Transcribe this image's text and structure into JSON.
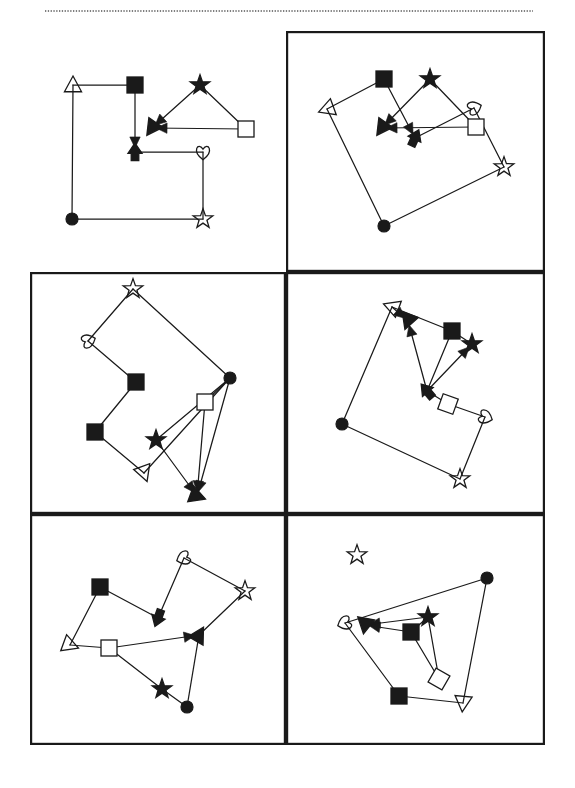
{
  "page": {
    "width": 575,
    "height": 788,
    "background_color": "#ffffff",
    "ink_color": "#1a1a1a",
    "header_rule": {
      "name": "dotted-header-rule",
      "style": "dotted",
      "x1": 45,
      "y1": 11,
      "x2": 533,
      "y2": 11,
      "color": "#555555"
    },
    "grid": {
      "columns": 2,
      "rows": 3,
      "border_color": "#1a1a1a",
      "border_width": 2.2,
      "cells": [
        {
          "name": "panel-top-left",
          "row": 1,
          "col": 1,
          "x": 30,
          "y": 31,
          "w": 256,
          "h": 241,
          "bordered": false
        },
        {
          "name": "panel-top-right",
          "row": 1,
          "col": 2,
          "x": 286,
          "y": 31,
          "w": 259,
          "h": 241,
          "bordered": true
        },
        {
          "name": "panel-middle-left",
          "row": 2,
          "col": 1,
          "x": 30,
          "y": 272,
          "w": 256,
          "h": 242,
          "bordered": true
        },
        {
          "name": "panel-middle-right",
          "row": 2,
          "col": 2,
          "x": 286,
          "y": 272,
          "w": 259,
          "h": 242,
          "bordered": true
        },
        {
          "name": "panel-bottom-left",
          "row": 3,
          "col": 1,
          "x": 30,
          "y": 514,
          "w": 256,
          "h": 231,
          "bordered": true
        },
        {
          "name": "panel-bottom-right",
          "row": 3,
          "col": 2,
          "x": 286,
          "y": 514,
          "w": 259,
          "h": 231,
          "bordered": true
        }
      ]
    }
  },
  "marker_legend": [
    {
      "key": "open-triangle",
      "label": "open triangle",
      "fill": "none",
      "stroke": "#1a1a1a"
    },
    {
      "key": "filled-triangle",
      "label": "filled triangle",
      "fill": "#1a1a1a",
      "stroke": "#1a1a1a"
    },
    {
      "key": "open-square",
      "label": "open square",
      "fill": "#ffffff",
      "stroke": "#1a1a1a"
    },
    {
      "key": "filled-square",
      "label": "filled square",
      "fill": "#1a1a1a",
      "stroke": "#1a1a1a"
    },
    {
      "key": "open-star",
      "label": "open star",
      "fill": "none",
      "stroke": "#1a1a1a"
    },
    {
      "key": "filled-star",
      "label": "filled star",
      "fill": "#1a1a1a",
      "stroke": "#1a1a1a"
    },
    {
      "key": "open-heart",
      "label": "open heart",
      "fill": "none",
      "stroke": "#1a1a1a"
    },
    {
      "key": "filled-circle",
      "label": "filled circle",
      "fill": "#1a1a1a",
      "stroke": "#1a1a1a"
    }
  ],
  "figures": [
    {
      "panel": "panel-top-left",
      "name": "figure-reference",
      "rotation_deg": 0,
      "nodes": [
        {
          "id": "n1",
          "shape": "open-triangle",
          "x": 73,
          "y": 85,
          "size": 9
        },
        {
          "id": "n2",
          "shape": "filled-square",
          "x": 135,
          "y": 85,
          "size": 8
        },
        {
          "id": "n3",
          "shape": "filled-arrow",
          "x": 135,
          "y": 152,
          "size": 9,
          "angle": 0
        },
        {
          "id": "n4",
          "shape": "open-heart",
          "x": 203,
          "y": 152,
          "size": 9
        },
        {
          "id": "n5",
          "shape": "open-star",
          "x": 203,
          "y": 219,
          "size": 9
        },
        {
          "id": "n6",
          "shape": "filled-circle",
          "x": 72,
          "y": 219,
          "size": 6
        },
        {
          "id": "n7",
          "shape": "filled-star",
          "x": 200,
          "y": 85,
          "size": 9
        },
        {
          "id": "n8",
          "shape": "open-square",
          "x": 246,
          "y": 129,
          "size": 8
        },
        {
          "id": "n9",
          "shape": "filled-triangle",
          "x": 152,
          "y": 128,
          "size": 9,
          "angle": 215
        }
      ],
      "edges": [
        {
          "from": "n1",
          "to": "n2",
          "arrow": false
        },
        {
          "from": "n2",
          "to": "n3",
          "arrow": true
        },
        {
          "from": "n3",
          "to": "n4",
          "arrow": false
        },
        {
          "from": "n4",
          "to": "n5",
          "arrow": false
        },
        {
          "from": "n5",
          "to": "n6",
          "arrow": false
        },
        {
          "from": "n6",
          "to": "n1",
          "arrow": false
        },
        {
          "from": "n7",
          "to": "n9",
          "arrow": true
        },
        {
          "from": "n7",
          "to": "n8",
          "arrow": false
        },
        {
          "from": "n8",
          "to": "n9",
          "arrow": true
        }
      ]
    },
    {
      "panel": "panel-top-right",
      "name": "figure-rotated-a",
      "rotation_deg": 20,
      "nodes": [
        {
          "id": "n1",
          "shape": "open-triangle",
          "x": 327,
          "y": 109,
          "size": 9,
          "angle": 250
        },
        {
          "id": "n2",
          "shape": "filled-square",
          "x": 384,
          "y": 79,
          "size": 8
        },
        {
          "id": "n3",
          "shape": "filled-arrow",
          "x": 415,
          "y": 138,
          "size": 9,
          "angle": 25
        },
        {
          "id": "n4",
          "shape": "open-heart",
          "x": 474,
          "y": 108,
          "size": 9,
          "angle": 250
        },
        {
          "id": "n5",
          "shape": "open-star",
          "x": 504,
          "y": 167,
          "size": 9
        },
        {
          "id": "n6",
          "shape": "filled-circle",
          "x": 384,
          "y": 226,
          "size": 6
        },
        {
          "id": "n7",
          "shape": "filled-star",
          "x": 430,
          "y": 79,
          "size": 9
        },
        {
          "id": "n8",
          "shape": "open-square",
          "x": 476,
          "y": 127,
          "size": 8
        },
        {
          "id": "n9",
          "shape": "filled-triangle",
          "x": 382,
          "y": 128,
          "size": 9,
          "angle": 215
        }
      ],
      "edges": [
        {
          "from": "n1",
          "to": "n2",
          "arrow": false
        },
        {
          "from": "n2",
          "to": "n3",
          "arrow": true
        },
        {
          "from": "n3",
          "to": "n4",
          "arrow": false
        },
        {
          "from": "n4",
          "to": "n5",
          "arrow": false
        },
        {
          "from": "n5",
          "to": "n6",
          "arrow": false
        },
        {
          "from": "n6",
          "to": "n1",
          "arrow": false
        },
        {
          "from": "n7",
          "to": "n9",
          "arrow": true
        },
        {
          "from": "n7",
          "to": "n8",
          "arrow": false
        },
        {
          "from": "n8",
          "to": "n9",
          "arrow": true
        }
      ]
    },
    {
      "panel": "panel-middle-left",
      "name": "figure-rotated-b",
      "rotation_deg": 130,
      "nodes": [
        {
          "id": "n1",
          "shape": "open-star",
          "x": 133,
          "y": 289,
          "size": 9
        },
        {
          "id": "n2",
          "shape": "open-heart",
          "x": 88,
          "y": 341,
          "size": 9,
          "angle": 250
        },
        {
          "id": "n3",
          "shape": "filled-square",
          "x": 136,
          "y": 382,
          "size": 8
        },
        {
          "id": "n4",
          "shape": "filled-square",
          "x": 95,
          "y": 432,
          "size": 8
        },
        {
          "id": "n5",
          "shape": "open-triangle",
          "x": 144,
          "y": 473,
          "size": 9,
          "angle": 160
        },
        {
          "id": "n6",
          "shape": "filled-circle",
          "x": 230,
          "y": 378,
          "size": 6
        },
        {
          "id": "n7",
          "shape": "open-square",
          "x": 205,
          "y": 402,
          "size": 8
        },
        {
          "id": "n8",
          "shape": "filled-star",
          "x": 156,
          "y": 440,
          "size": 9
        },
        {
          "id": "n9",
          "shape": "filled-triangle",
          "x": 197,
          "y": 496,
          "size": 9,
          "angle": 110
        }
      ],
      "edges": [
        {
          "from": "n1",
          "to": "n2",
          "arrow": false
        },
        {
          "from": "n2",
          "to": "n3",
          "arrow": false
        },
        {
          "from": "n3",
          "to": "n4",
          "arrow": false
        },
        {
          "from": "n4",
          "to": "n5",
          "arrow": false
        },
        {
          "from": "n5",
          "to": "n6",
          "arrow": false
        },
        {
          "from": "n6",
          "to": "n1",
          "arrow": false
        },
        {
          "from": "n6",
          "to": "n7",
          "arrow": false
        },
        {
          "from": "n6",
          "to": "n8",
          "arrow": false
        },
        {
          "from": "n7",
          "to": "n9",
          "arrow": true
        },
        {
          "from": "n8",
          "to": "n9",
          "arrow": true
        },
        {
          "from": "n6",
          "to": "n9",
          "arrow": true
        }
      ]
    },
    {
      "panel": "panel-middle-right",
      "name": "figure-rotated-c",
      "rotation_deg": 310,
      "nodes": [
        {
          "id": "n1",
          "shape": "open-triangle",
          "x": 392,
          "y": 307,
          "size": 9,
          "angle": 290
        },
        {
          "id": "n2",
          "shape": "filled-square",
          "x": 452,
          "y": 331,
          "size": 8
        },
        {
          "id": "n3",
          "shape": "filled-star",
          "x": 472,
          "y": 344,
          "size": 9
        },
        {
          "id": "n4",
          "shape": "filled-triangle",
          "x": 408,
          "y": 321,
          "size": 9,
          "angle": 200
        },
        {
          "id": "n5",
          "shape": "filled-arrow",
          "x": 427,
          "y": 391,
          "size": 9,
          "angle": 320
        },
        {
          "id": "n6",
          "shape": "open-square",
          "x": 448,
          "y": 404,
          "size": 8,
          "angle": 20
        },
        {
          "id": "n7",
          "shape": "open-heart",
          "x": 485,
          "y": 417,
          "size": 9,
          "angle": 290
        },
        {
          "id": "n8",
          "shape": "open-star",
          "x": 460,
          "y": 479,
          "size": 9
        },
        {
          "id": "n9",
          "shape": "filled-circle",
          "x": 342,
          "y": 424,
          "size": 6
        }
      ],
      "edges": [
        {
          "from": "n1",
          "to": "n2",
          "arrow": false
        },
        {
          "from": "n1",
          "to": "n4",
          "arrow": true
        },
        {
          "from": "n5",
          "to": "n4",
          "arrow": true
        },
        {
          "from": "n5",
          "to": "n2",
          "arrow": false
        },
        {
          "from": "n5",
          "to": "n3",
          "arrow": true
        },
        {
          "from": "n2",
          "to": "n3",
          "arrow": false
        },
        {
          "from": "n5",
          "to": "n6",
          "arrow": false
        },
        {
          "from": "n6",
          "to": "n7",
          "arrow": false
        },
        {
          "from": "n7",
          "to": "n8",
          "arrow": false
        },
        {
          "from": "n8",
          "to": "n9",
          "arrow": false
        },
        {
          "from": "n9",
          "to": "n1",
          "arrow": false
        }
      ]
    },
    {
      "panel": "panel-bottom-left",
      "name": "figure-rotated-d",
      "rotation_deg": 200,
      "nodes": [
        {
          "id": "n1",
          "shape": "open-heart",
          "x": 184,
          "y": 558,
          "size": 9,
          "angle": 70
        },
        {
          "id": "n2",
          "shape": "open-star",
          "x": 245,
          "y": 591,
          "size": 9
        },
        {
          "id": "n3",
          "shape": "filled-square",
          "x": 100,
          "y": 587,
          "size": 8
        },
        {
          "id": "n4",
          "shape": "filled-arrow",
          "x": 158,
          "y": 618,
          "size": 9,
          "angle": 200
        },
        {
          "id": "n5",
          "shape": "open-triangle",
          "x": 70,
          "y": 645,
          "size": 9,
          "angle": 110
        },
        {
          "id": "n6",
          "shape": "open-square",
          "x": 109,
          "y": 648,
          "size": 8
        },
        {
          "id": "n7",
          "shape": "filled-triangle",
          "x": 199,
          "y": 635,
          "size": 9,
          "angle": 30
        },
        {
          "id": "n8",
          "shape": "filled-star",
          "x": 162,
          "y": 689,
          "size": 9
        },
        {
          "id": "n9",
          "shape": "filled-circle",
          "x": 187,
          "y": 707,
          "size": 6
        }
      ],
      "edges": [
        {
          "from": "n1",
          "to": "n2",
          "arrow": false
        },
        {
          "from": "n1",
          "to": "n4",
          "arrow": false
        },
        {
          "from": "n4",
          "to": "n3",
          "arrow": false
        },
        {
          "from": "n3",
          "to": "n5",
          "arrow": false
        },
        {
          "from": "n5",
          "to": "n6",
          "arrow": false
        },
        {
          "from": "n6",
          "to": "n7",
          "arrow": true
        },
        {
          "from": "n2",
          "to": "n7",
          "arrow": false
        },
        {
          "from": "n6",
          "to": "n8",
          "arrow": false
        },
        {
          "from": "n8",
          "to": "n9",
          "arrow": false
        },
        {
          "from": "n9",
          "to": "n7",
          "arrow": false
        }
      ]
    },
    {
      "panel": "panel-bottom-right",
      "name": "figure-rotated-e",
      "rotation_deg": 75,
      "nodes": [
        {
          "id": "n0",
          "shape": "open-star",
          "x": 357,
          "y": 555,
          "size": 9,
          "detached": true
        },
        {
          "id": "n1",
          "shape": "filled-circle",
          "x": 487,
          "y": 578,
          "size": 6
        },
        {
          "id": "n2",
          "shape": "open-heart",
          "x": 345,
          "y": 623,
          "size": 9,
          "angle": 70
        },
        {
          "id": "n3",
          "shape": "filled-triangle",
          "x": 365,
          "y": 625,
          "size": 9,
          "angle": 190
        },
        {
          "id": "n4",
          "shape": "filled-star",
          "x": 428,
          "y": 617,
          "size": 9
        },
        {
          "id": "n5",
          "shape": "filled-square",
          "x": 411,
          "y": 632,
          "size": 8
        },
        {
          "id": "n6",
          "shape": "open-square",
          "x": 439,
          "y": 679,
          "size": 8,
          "angle": 30
        },
        {
          "id": "n7",
          "shape": "filled-square",
          "x": 399,
          "y": 696,
          "size": 8
        },
        {
          "id": "n8",
          "shape": "open-triangle",
          "x": 463,
          "y": 703,
          "size": 9,
          "angle": 185
        }
      ],
      "edges": [
        {
          "from": "n1",
          "to": "n2",
          "arrow": false
        },
        {
          "from": "n4",
          "to": "n3",
          "arrow": true
        },
        {
          "from": "n5",
          "to": "n3",
          "arrow": true
        },
        {
          "from": "n4",
          "to": "n5",
          "arrow": false
        },
        {
          "from": "n4",
          "to": "n6",
          "arrow": false
        },
        {
          "from": "n5",
          "to": "n6",
          "arrow": false
        },
        {
          "from": "n2",
          "to": "n7",
          "arrow": false
        },
        {
          "from": "n7",
          "to": "n8",
          "arrow": false
        },
        {
          "from": "n8",
          "to": "n1",
          "arrow": false
        }
      ]
    }
  ]
}
